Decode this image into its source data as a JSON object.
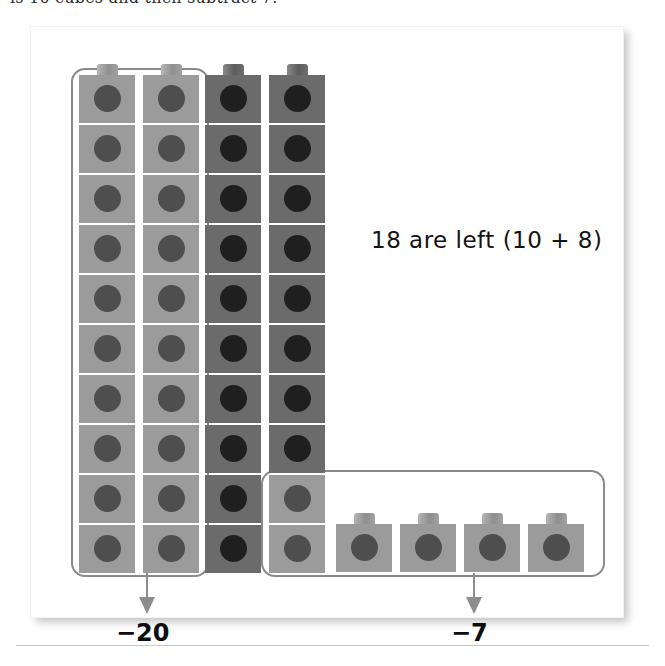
{
  "heading_clipped": "is 10 cubes and then subtract 7.",
  "center_note": "18 are left (10 + 8)",
  "labels": {
    "left_operation": "−20",
    "right_operation": "−7"
  },
  "groups": {
    "left_box": {
      "name": "subtract-twenty-group",
      "cube_count": 20,
      "columns": 2,
      "rows": 10
    },
    "right_box": {
      "name": "subtract-seven-group",
      "cube_count": 7,
      "stacked_cubes": 2,
      "loose_cubes": 5
    }
  },
  "stacks": [
    {
      "id": "stack-1",
      "count": 10,
      "shades": [
        "light",
        "light",
        "light",
        "light",
        "light",
        "light",
        "light",
        "light",
        "light",
        "light"
      ]
    },
    {
      "id": "stack-2",
      "count": 10,
      "shades": [
        "light",
        "light",
        "light",
        "light",
        "light",
        "light",
        "light",
        "light",
        "light",
        "light"
      ]
    },
    {
      "id": "stack-3",
      "count": 10,
      "shades": [
        "dark",
        "dark",
        "dark",
        "dark",
        "dark",
        "dark",
        "dark",
        "dark",
        "dark",
        "dark"
      ]
    },
    {
      "id": "stack-4",
      "count": 10,
      "shades": [
        "dark",
        "dark",
        "dark",
        "dark",
        "dark",
        "dark",
        "dark",
        "dark",
        "light",
        "light"
      ]
    }
  ],
  "loose_cubes": [
    {
      "id": "loose-1",
      "shade": "light"
    },
    {
      "id": "loose-2",
      "shade": "light"
    },
    {
      "id": "loose-3",
      "shade": "light"
    },
    {
      "id": "loose-4",
      "shade": "light"
    },
    {
      "id": "loose-5",
      "shade": "light"
    }
  ],
  "colors": {
    "cube_light_body": "#9b9b9b",
    "cube_light_dot": "#4e4e4e",
    "cube_dark_body": "#6b6b6b",
    "cube_dark_dot": "#1f1f1f",
    "selection_box": "#8a8a8a",
    "arrow": "#8d8d8d",
    "panel_background": "#ffffff",
    "text": "#0d0d0d"
  },
  "chart_data": {
    "type": "bar",
    "categories": [
      "Stack 1",
      "Stack 2",
      "Stack 3",
      "Stack 4",
      "Loose cubes"
    ],
    "values": [
      10,
      10,
      10,
      10,
      5
    ],
    "xlabel": "",
    "ylabel": "Cubes",
    "ylim": [
      0,
      10
    ],
    "annotations": [
      "−20",
      "−7",
      "18 are left (10 + 8)"
    ],
    "total_cubes": 45,
    "removed": 27,
    "remaining": 18
  }
}
